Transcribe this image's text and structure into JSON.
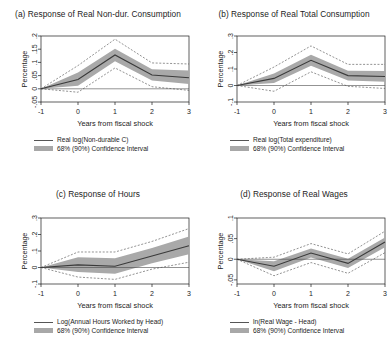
{
  "figure": {
    "xlabel": "Years from fiscal shock",
    "ylabel": "Percentage",
    "ci_legend_label": "68% (90%) Confidence Interval",
    "band_color": "#a9a9a9",
    "line_color": "#3a3a3a",
    "ci_color": "#4a4a4a"
  },
  "chart_data": [
    {
      "id": "panel-a",
      "type": "line",
      "title": "(a) Response of Real Non-dur. Consumption",
      "xlabel": "Years from fiscal shock",
      "ylabel": "Percentage",
      "series_label": "Real log(Non-durable C)",
      "ci_label": "68% (90%) Confidence Interval",
      "x": [
        -1,
        0,
        1,
        2,
        3
      ],
      "xticks": [
        "-1",
        "0",
        "1",
        "2",
        "3"
      ],
      "xlim": [
        -1,
        3
      ],
      "yticks": [
        "-.05",
        "0",
        ".05",
        ".1",
        ".15",
        ".2"
      ],
      "ytickvals": [
        -0.05,
        0,
        0.05,
        0.1,
        0.15,
        0.2
      ],
      "ylim": [
        -0.05,
        0.2
      ],
      "grid": false,
      "legend_position": "below",
      "series": [
        {
          "name": "Real log(Non-durable C)",
          "values": [
            0.0,
            0.035,
            0.128,
            0.052,
            0.042
          ]
        },
        {
          "name": "68% lower",
          "values": [
            0.0,
            0.012,
            0.104,
            0.031,
            0.018
          ]
        },
        {
          "name": "68% upper",
          "values": [
            0.0,
            0.062,
            0.152,
            0.074,
            0.069
          ]
        },
        {
          "name": "90% lower",
          "values": [
            0.0,
            -0.013,
            0.079,
            0.008,
            -0.006
          ]
        },
        {
          "name": "90% upper",
          "values": [
            0.0,
            0.088,
            0.188,
            0.098,
            0.094
          ]
        }
      ]
    },
    {
      "id": "panel-b",
      "type": "line",
      "title": "(b) Response of Real Total Consumption",
      "xlabel": "Years from fiscal shock",
      "ylabel": "Percentage",
      "series_label": "Real log(Total expenditure)",
      "ci_label": "68% (90%) Confidence Interval",
      "x": [
        -1,
        0,
        1,
        2,
        3
      ],
      "xticks": [
        "-1",
        "0",
        "1",
        "2",
        "3"
      ],
      "xlim": [
        -1,
        3
      ],
      "yticks": [
        "-.1",
        "0",
        ".1",
        ".2",
        ".3"
      ],
      "ytickvals": [
        -0.1,
        0,
        0.1,
        0.2,
        0.3
      ],
      "ylim": [
        -0.1,
        0.3
      ],
      "grid": false,
      "legend_position": "below",
      "series": [
        {
          "name": "Real log(Total expenditure)",
          "values": [
            0.0,
            0.043,
            0.153,
            0.06,
            0.055
          ]
        },
        {
          "name": "68% lower",
          "values": [
            0.0,
            0.015,
            0.12,
            0.03,
            0.022
          ]
        },
        {
          "name": "68% upper",
          "values": [
            0.0,
            0.073,
            0.187,
            0.09,
            0.088
          ]
        },
        {
          "name": "90% lower",
          "values": [
            0.0,
            -0.035,
            0.083,
            -0.005,
            -0.018
          ]
        },
        {
          "name": "90% upper",
          "values": [
            0.0,
            0.112,
            0.24,
            0.128,
            0.128
          ]
        }
      ]
    },
    {
      "id": "panel-c",
      "type": "line",
      "title": "(c) Response of Hours",
      "xlabel": "Years from fiscal shock",
      "ylabel": "Percentage",
      "series_label": "Log(Annual Hours Worked by Head)",
      "ci_label": "68% (90%) Confidence Interval",
      "x": [
        -1,
        0,
        1,
        2,
        3
      ],
      "xticks": [
        "-1",
        "0",
        "1",
        "2",
        "3"
      ],
      "xlim": [
        -1,
        3
      ],
      "yticks": [
        "-.1",
        "0",
        ".1",
        ".2",
        ".3"
      ],
      "ytickvals": [
        -0.1,
        0,
        0.1,
        0.2,
        0.3
      ],
      "ylim": [
        -0.1,
        0.3
      ],
      "grid": false,
      "legend_position": "below",
      "series": [
        {
          "name": "Log(Annual Hours Worked by Head)",
          "values": [
            0.0,
            0.016,
            0.008,
            0.07,
            0.132
          ]
        },
        {
          "name": "68% lower",
          "values": [
            0.0,
            -0.028,
            -0.038,
            0.026,
            0.08
          ]
        },
        {
          "name": "68% upper",
          "values": [
            0.0,
            0.062,
            0.056,
            0.118,
            0.188
          ]
        },
        {
          "name": "90% lower",
          "values": [
            0.0,
            -0.058,
            -0.072,
            -0.01,
            0.032
          ]
        },
        {
          "name": "90% upper",
          "values": [
            0.0,
            0.094,
            0.094,
            0.158,
            0.236
          ]
        }
      ]
    },
    {
      "id": "panel-d",
      "type": "line",
      "title": "(d) Response of Real Wages",
      "xlabel": "Years from fiscal shock",
      "ylabel": "Percentage",
      "series_label": "ln(Real Wage - Head)",
      "ci_label": "68% (90%) Confidence Interval",
      "x": [
        -1,
        0,
        1,
        2,
        3
      ],
      "xticks": [
        "-1",
        "0",
        "1",
        "2",
        "3"
      ],
      "xlim": [
        -1,
        3
      ],
      "yticks": [
        "-.05",
        "0",
        ".05",
        ".1"
      ],
      "ytickvals": [
        -0.05,
        0,
        0.05,
        0.1
      ],
      "ylim": [
        -0.06,
        0.1
      ],
      "grid": false,
      "legend_position": "below",
      "series": [
        {
          "name": "ln(Real Wage - Head)",
          "values": [
            0.0,
            -0.017,
            0.015,
            -0.01,
            0.042
          ]
        },
        {
          "name": "68% lower",
          "values": [
            0.0,
            -0.029,
            0.004,
            -0.021,
            0.029
          ]
        },
        {
          "name": "68% upper",
          "values": [
            0.0,
            -0.005,
            0.026,
            0.001,
            0.053
          ]
        },
        {
          "name": "90% lower",
          "values": [
            0.0,
            -0.04,
            -0.008,
            -0.034,
            0.016
          ]
        },
        {
          "name": "90% upper",
          "values": [
            0.0,
            0.005,
            0.038,
            0.013,
            0.068
          ]
        }
      ]
    }
  ]
}
